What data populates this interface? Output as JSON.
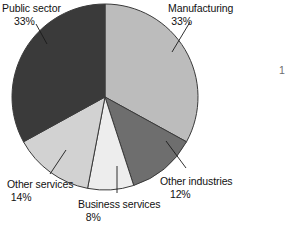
{
  "chart_data": {
    "type": "pie",
    "title": "",
    "subtitle": "",
    "xlabel": "",
    "ylabel": "",
    "legend_position": "none",
    "grid": false,
    "start_angle_deg": 0,
    "direction": "clockwise",
    "center": {
      "x": 105,
      "y": 97
    },
    "radius": 93,
    "categories": [
      "Manufacturing",
      "Other industries",
      "Business services",
      "Other services",
      "Public sector"
    ],
    "values": [
      33,
      12,
      8,
      14,
      33
    ],
    "value_suffix": "%",
    "slices": [
      {
        "label": "Manufacturing",
        "value": 33,
        "value_text": "33%",
        "color": "#bcbcbc",
        "start_deg": 0,
        "end_deg": 118.8,
        "label_align": "left",
        "leader": {
          "x1": 190,
          "y1": 22,
          "x2": 172,
          "y2": 52
        }
      },
      {
        "label": "Other industries",
        "value": 12,
        "value_text": "12%",
        "color": "#6e6e6e",
        "start_deg": 118.8,
        "end_deg": 162.0,
        "label_align": "left",
        "leader": {
          "x1": 186,
          "y1": 168,
          "x2": 166,
          "y2": 141
        }
      },
      {
        "label": "Business services",
        "value": 8,
        "value_text": "8%",
        "color": "#ededed",
        "start_deg": 162.0,
        "end_deg": 190.8,
        "label_align": "center",
        "leader": {
          "x1": 117,
          "y1": 193,
          "x2": 117,
          "y2": 166
        }
      },
      {
        "label": "Other services",
        "value": 14,
        "value_text": "14%",
        "color": "#d2d2d2",
        "start_deg": 190.8,
        "end_deg": 241.2,
        "label_align": "left",
        "leader": {
          "x1": 50,
          "y1": 174,
          "x2": 66,
          "y2": 150
        }
      },
      {
        "label": "Public sector",
        "value": 33,
        "value_text": "33%",
        "color": "#3a3a3a",
        "start_deg": 241.2,
        "end_deg": 360.0,
        "label_align": "left",
        "leader": {
          "x1": 36,
          "y1": 24,
          "x2": 47,
          "y2": 44
        }
      }
    ],
    "stroke_color": "#3a3a3a",
    "background": "#ffffff"
  },
  "labels": {
    "public_sector": {
      "name": "Public sector",
      "value": "33%"
    },
    "manufacturing": {
      "name": "Manufacturing",
      "value": "33%"
    },
    "other_industries": {
      "name": "Other industries",
      "value": "12%"
    },
    "business_services": {
      "name": "Business services",
      "value": "8%"
    },
    "other_services": {
      "name": "Other services",
      "value": "14%"
    }
  },
  "edge_artifact": {
    "text": "1"
  }
}
